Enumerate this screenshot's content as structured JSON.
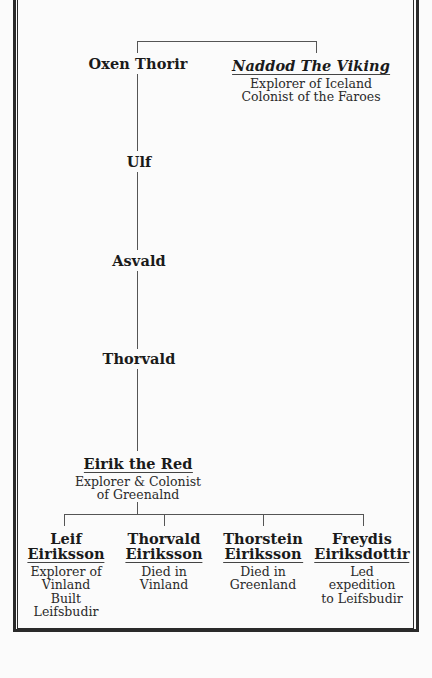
{
  "colors": {
    "background": "#fbfbfb",
    "frame": "#2a2a2a",
    "lines": "#555555",
    "text": "#1a1a1a"
  },
  "ancestors": {
    "oxen_thorir": {
      "name": "Oxen Thorir"
    },
    "naddod": {
      "name": "Naddod The Viking",
      "desc": [
        "Explorer of Iceland",
        "Colonist of the Faroes"
      ]
    },
    "ulf": {
      "name": "Ulf"
    },
    "asvald": {
      "name": "Asvald"
    },
    "thorvald": {
      "name": "Thorvald"
    },
    "eirik": {
      "name": "Eirik the Red",
      "desc": [
        "Explorer & Colonist",
        "of Greenalnd"
      ]
    }
  },
  "children": [
    {
      "name": [
        "Leif",
        "Eiriksson"
      ],
      "desc": [
        "Explorer of",
        "Vinland",
        "Built",
        "Leifsbudir"
      ]
    },
    {
      "name": [
        "Thorvald",
        "Eiriksson"
      ],
      "desc": [
        "Died in",
        "Vinland"
      ]
    },
    {
      "name": [
        "Thorstein",
        "Eiriksson"
      ],
      "desc": [
        "Died in",
        "Greenland"
      ]
    },
    {
      "name": [
        "Freydis",
        "Eiriksdottir"
      ],
      "desc": [
        "Led",
        "expedition",
        "to Leifsbudir"
      ]
    }
  ]
}
